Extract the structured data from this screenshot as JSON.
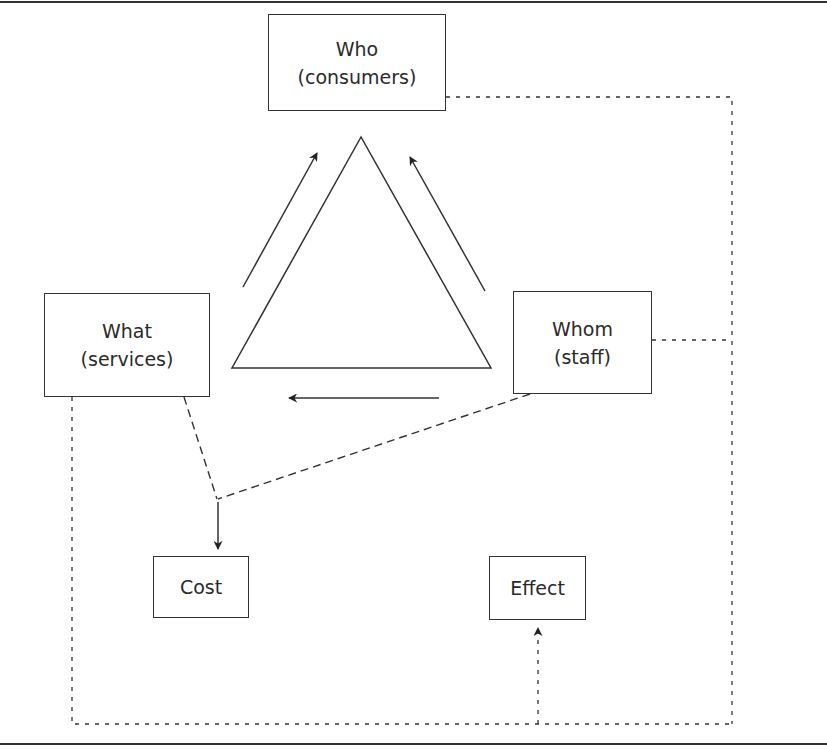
{
  "diagram": {
    "nodes": {
      "who": {
        "line1": "Who",
        "line2": "(consumers)"
      },
      "what": {
        "line1": "What",
        "line2": "(services)"
      },
      "whom": {
        "line1": "Whom",
        "line2": "(staff)"
      },
      "cost": {
        "line1": "Cost"
      },
      "effect": {
        "line1": "Effect"
      }
    },
    "edges": [
      {
        "from": "what",
        "to": "who",
        "style": "solid-arrow"
      },
      {
        "from": "whom",
        "to": "who",
        "style": "solid-arrow"
      },
      {
        "from": "whom",
        "to": "what",
        "style": "solid-arrow"
      },
      {
        "from": "what",
        "to": "cost",
        "style": "dashed"
      },
      {
        "from": "whom",
        "to": "cost",
        "style": "dashed-arrow"
      },
      {
        "from": "who",
        "to": "effect",
        "style": "dotted-arrow"
      },
      {
        "from": "whom",
        "to": "effect",
        "style": "dotted-arrow"
      },
      {
        "from": "what",
        "to": "effect",
        "style": "dotted-arrow"
      }
    ],
    "center_shape": "triangle",
    "colors": {
      "line": "#333333",
      "background": "#ffffff"
    }
  }
}
